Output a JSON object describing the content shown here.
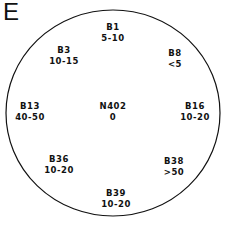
{
  "panel_label": "E",
  "center": {
    "name": "N402",
    "value": "0"
  },
  "sites": [
    {
      "name": "B1",
      "value": "5-10",
      "x": 113,
      "y": 22
    },
    {
      "name": "B3",
      "value": "10-15",
      "x": 64,
      "y": 45
    },
    {
      "name": "B8",
      "value": "<5",
      "x": 175,
      "y": 48
    },
    {
      "name": "B13",
      "value": "40-50",
      "x": 28,
      "y": 101
    },
    {
      "name": "B16",
      "value": "10-20",
      "x": 196,
      "y": 101
    },
    {
      "name": "B36",
      "value": "10-20",
      "x": 59,
      "y": 154
    },
    {
      "name": "B38",
      "value": ">50",
      "x": 174,
      "y": 156
    },
    {
      "name": "B39",
      "value": "10-20",
      "x": 116,
      "y": 188
    }
  ],
  "colors": {
    "stroke": "#111111",
    "background": "#ffffff"
  }
}
